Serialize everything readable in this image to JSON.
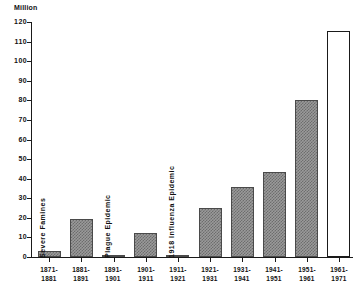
{
  "chart_data": {
    "type": "bar",
    "title": "",
    "subtitle": "",
    "xlabel": "",
    "ylabel": "Million",
    "ylim": [
      0,
      120
    ],
    "ytick_step": 10,
    "yticks": [
      120,
      110,
      100,
      90,
      80,
      70,
      60,
      50,
      40,
      30,
      20,
      10,
      0
    ],
    "ytick_labels": [
      "120",
      "110",
      "100",
      "90",
      "80",
      "70",
      "60",
      "50",
      "40",
      "30",
      "20",
      "10",
      "0"
    ],
    "grid": false,
    "legend": null,
    "categories": [
      "1871-1881",
      "1881-1891",
      "1891-1901",
      "1901-1911",
      "1911-1921",
      "1921-1931",
      "1931-1941",
      "1941-1951",
      "1951-1961",
      "1961-1971"
    ],
    "category_label_lines": [
      [
        "1871-",
        "1881"
      ],
      [
        "1881-",
        "1891"
      ],
      [
        "1891-",
        "1901"
      ],
      [
        "1901-",
        "1911"
      ],
      [
        "1911-",
        "1921"
      ],
      [
        "1921-",
        "1931"
      ],
      [
        "1931-",
        "1941"
      ],
      [
        "1941-",
        "1951"
      ],
      [
        "1951-",
        "1961"
      ],
      [
        "1961-",
        "1971"
      ]
    ],
    "values": [
      3,
      19.5,
      1,
      12.5,
      0.3,
      25,
      36,
      43.5,
      80,
      115.5
    ],
    "bar_styles": [
      "filled",
      "filled",
      "filled",
      "filled",
      "filled",
      "filled",
      "filled",
      "filled",
      "filled",
      "hollow"
    ],
    "annotations": [
      {
        "text": "Severe Famines",
        "category": "1871-1881"
      },
      {
        "text": "Plague Epidemic",
        "category": "1891-1901"
      },
      {
        "text": "1918 Influenza Epidemic",
        "category": "1911-1921"
      }
    ],
    "colors": {
      "axis": "#1a1a1a",
      "bar_fill": "#9a9a9a",
      "bar_hatch": "#6d6d6d",
      "bar_edge": "#4a4a4a",
      "hollow_edge": "#1a1a1a",
      "text": "#111111",
      "background": "#ffffff"
    }
  }
}
